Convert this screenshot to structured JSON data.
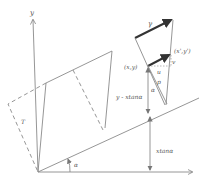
{
  "diagram": {
    "labels": {
      "y_axis": "y",
      "gamma": "γ",
      "point": "(x,y)",
      "point_prime": "(x',y')",
      "u": "u",
      "v": "v",
      "p": "p",
      "alpha_small": "α",
      "alpha_angle": "α",
      "t": "T",
      "y_minus": "y - xtanα",
      "x_tan": "xtanα"
    }
  }
}
